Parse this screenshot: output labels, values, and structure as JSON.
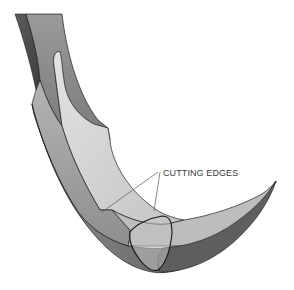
{
  "figure": {
    "annotation": {
      "label": "CUTTING EDGES",
      "leader_count": 2
    },
    "colors": {
      "background": "#ffffff",
      "outline": "#1e1e1e",
      "dark_face": "#5a5a5a",
      "mid_face": "#8c8c8c",
      "light_face": "#d2d2d2",
      "leader_line": "#555555",
      "label_text": "#3a3a3a"
    }
  }
}
